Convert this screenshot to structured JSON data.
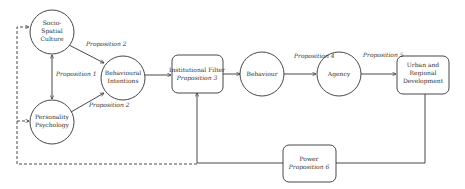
{
  "diagram": {
    "nodes": {
      "socio_spatial_culture": {
        "lines": [
          "Socio-",
          "Spatial",
          "Culture"
        ],
        "shape": "circle"
      },
      "personality_psychology": {
        "lines": [
          "Personality",
          "Psychology"
        ],
        "shape": "circle"
      },
      "behavioural_intentions": {
        "lines": [
          "Behavioural",
          "Intentions"
        ],
        "shape": "circle"
      },
      "institutional_filter": {
        "lines": [
          "Institutional Filter"
        ],
        "proposition": "Proposition 3",
        "shape": "rounded-box"
      },
      "behaviour": {
        "lines": [
          "Behaviour"
        ],
        "shape": "circle"
      },
      "agency": {
        "lines": [
          "Agency"
        ],
        "shape": "circle"
      },
      "urban_regional_development": {
        "lines": [
          "Urban and",
          "Regional",
          "Development"
        ],
        "shape": "rounded-box"
      },
      "power": {
        "lines": [
          "Power"
        ],
        "proposition": "Proposition 6",
        "shape": "rounded-box"
      }
    },
    "edge_labels": {
      "culture_to_intentions": "Proposition 2",
      "culture_personality": "Proposition 1",
      "personality_to_intentions": "Proposition 2",
      "behaviour_to_agency": "Proposition 4",
      "agency_to_urban": "Proposition 5"
    }
  }
}
